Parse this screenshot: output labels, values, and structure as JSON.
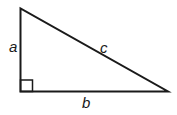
{
  "diagram": {
    "type": "right-triangle",
    "labels": {
      "vertical_leg": "a",
      "horizontal_leg": "b",
      "hypotenuse": "c"
    },
    "right_angle_marker": true,
    "colors": {
      "stroke": "#1a1a1a",
      "background": "#ffffff"
    }
  }
}
